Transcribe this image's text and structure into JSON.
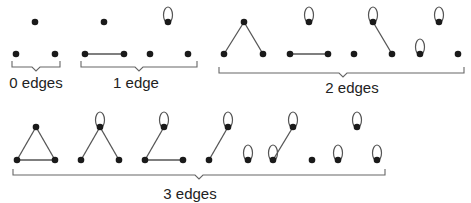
{
  "colors": {
    "ink": "#1a1a1a",
    "line": "#555555",
    "bracket": "#666666"
  },
  "groups": [
    {
      "label": "0 edges",
      "label_x": 36,
      "label_y": 74,
      "bracket": {
        "x1": 12,
        "x2": 60,
        "y": 67,
        "tip_x": 36
      }
    },
    {
      "label": "1 edge",
      "label_x": 136,
      "label_y": 74,
      "bracket": {
        "x1": 81,
        "x2": 197,
        "y": 67,
        "tip_x": 139
      }
    },
    {
      "label": "2 edges",
      "label_x": 352,
      "label_y": 79,
      "bracket": {
        "x1": 219,
        "x2": 464,
        "y": 73,
        "tip_x": 343
      }
    },
    {
      "label": "3 edges",
      "label_x": 190,
      "label_y": 185,
      "bracket": {
        "x1": 13,
        "x2": 385,
        "y": 175,
        "tip_x": 199
      }
    }
  ],
  "graphs": [
    {
      "id": "g0",
      "nodes": [
        [
          35,
          22
        ],
        [
          16,
          54
        ],
        [
          55,
          54
        ]
      ],
      "edges": [],
      "loops": []
    },
    {
      "id": "g1a",
      "nodes": [
        [
          104,
          22
        ],
        [
          85,
          54
        ],
        [
          124,
          54
        ]
      ],
      "edges": [
        [
          1,
          2
        ]
      ],
      "loops": []
    },
    {
      "id": "g1b",
      "nodes": [
        [
          168,
          22
        ],
        [
          150,
          54
        ],
        [
          188,
          54
        ]
      ],
      "edges": [],
      "loops": [
        0
      ]
    },
    {
      "id": "g2a",
      "nodes": [
        [
          244,
          22
        ],
        [
          224,
          54
        ],
        [
          263,
          54
        ]
      ],
      "edges": [
        [
          0,
          1
        ],
        [
          0,
          2
        ]
      ],
      "loops": []
    },
    {
      "id": "g2b",
      "nodes": [
        [
          309,
          22
        ],
        [
          290,
          54
        ],
        [
          328,
          54
        ]
      ],
      "edges": [
        [
          1,
          2
        ]
      ],
      "loops": [
        0
      ]
    },
    {
      "id": "g2c",
      "nodes": [
        [
          373,
          22
        ],
        [
          354,
          54
        ],
        [
          392,
          54
        ]
      ],
      "edges": [
        [
          0,
          2
        ]
      ],
      "loops": [
        0
      ]
    },
    {
      "id": "g2d",
      "nodes": [
        [
          439,
          22
        ],
        [
          420,
          54
        ],
        [
          458,
          54
        ]
      ],
      "edges": [],
      "loops": [
        0,
        1
      ]
    },
    {
      "id": "g3a",
      "nodes": [
        [
          36,
          127
        ],
        [
          17,
          160
        ],
        [
          55,
          160
        ]
      ],
      "edges": [
        [
          0,
          1
        ],
        [
          0,
          2
        ],
        [
          1,
          2
        ]
      ],
      "loops": []
    },
    {
      "id": "g3b",
      "nodes": [
        [
          100,
          127
        ],
        [
          81,
          160
        ],
        [
          119,
          160
        ]
      ],
      "edges": [
        [
          0,
          1
        ],
        [
          0,
          2
        ]
      ],
      "loops": [
        0
      ]
    },
    {
      "id": "g3c",
      "nodes": [
        [
          164,
          127
        ],
        [
          145,
          160
        ],
        [
          183,
          160
        ]
      ],
      "edges": [
        [
          0,
          1
        ],
        [
          1,
          2
        ]
      ],
      "loops": [
        0
      ]
    },
    {
      "id": "g3d",
      "nodes": [
        [
          228,
          127
        ],
        [
          209,
          160
        ],
        [
          248,
          160
        ]
      ],
      "edges": [
        [
          0,
          1
        ]
      ],
      "loops": [
        0,
        2
      ]
    },
    {
      "id": "g3e",
      "nodes": [
        [
          293,
          127
        ],
        [
          273,
          160
        ],
        [
          312,
          160
        ]
      ],
      "edges": [
        [
          0,
          1
        ]
      ],
      "loops": [
        0,
        1
      ]
    },
    {
      "id": "g3f",
      "nodes": [
        [
          357,
          127
        ],
        [
          338,
          160
        ],
        [
          377,
          160
        ]
      ],
      "edges": [],
      "loops": [
        0,
        1,
        2
      ]
    }
  ]
}
